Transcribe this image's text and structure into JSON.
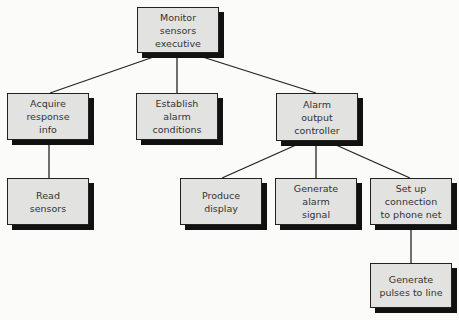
{
  "diagram": {
    "type": "structure-chart",
    "nodes": [
      {
        "id": "root",
        "label": "Monitor\nsensors\nexecutive"
      },
      {
        "id": "acquire",
        "label": "Acquire\nresponse\ninfo"
      },
      {
        "id": "establish",
        "label": "Establish\nalarm\nconditions"
      },
      {
        "id": "alarm",
        "label": "Alarm\noutput\ncontroller"
      },
      {
        "id": "read",
        "label": "Read\nsensors"
      },
      {
        "id": "produce",
        "label": "Produce\ndisplay"
      },
      {
        "id": "generate_alarm",
        "label": "Generate\nalarm\nsignal"
      },
      {
        "id": "setup",
        "label": "Set up\nconnection\nto phone net"
      },
      {
        "id": "pulses",
        "label": "Generate\npulses to line"
      }
    ],
    "edges": [
      [
        "root",
        "acquire"
      ],
      [
        "root",
        "establish"
      ],
      [
        "root",
        "alarm"
      ],
      [
        "acquire",
        "read"
      ],
      [
        "alarm",
        "produce"
      ],
      [
        "alarm",
        "generate_alarm"
      ],
      [
        "alarm",
        "setup"
      ],
      [
        "setup",
        "pulses"
      ]
    ]
  }
}
